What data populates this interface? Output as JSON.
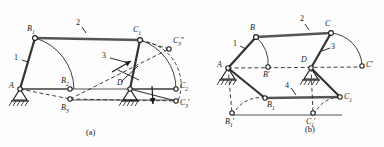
{
  "figure": {
    "type": "mechanism-kinematic-diagram",
    "colors": {
      "ink": "#1a1a1a",
      "link_bar": "#4a4a4a",
      "dashed": "#2b2b2b",
      "background": "#fdfdfd"
    }
  },
  "panels": [
    {
      "id": "a",
      "caption": "(a)",
      "link_labels": [
        {
          "key": "link1",
          "text": "1"
        },
        {
          "key": "link2",
          "text": "2"
        },
        {
          "key": "link3",
          "text": "3"
        }
      ],
      "point_labels": [
        {
          "key": "A",
          "base": "A",
          "sub": "",
          "prime": ""
        },
        {
          "key": "B1",
          "base": "B",
          "sub": "1",
          "prime": ""
        },
        {
          "key": "B2",
          "base": "B",
          "sub": "2",
          "prime": ""
        },
        {
          "key": "B3",
          "base": "B",
          "sub": "3",
          "prime": ""
        },
        {
          "key": "C1",
          "base": "C",
          "sub": "1",
          "prime": ""
        },
        {
          "key": "C2",
          "base": "C",
          "sub": "2",
          "prime": ""
        },
        {
          "key": "C3pp",
          "base": "C",
          "sub": "3",
          "prime": "″"
        },
        {
          "key": "C3p",
          "base": "C",
          "sub": "3",
          "prime": "′"
        },
        {
          "key": "D",
          "base": "D",
          "sub": "",
          "prime": ""
        }
      ]
    },
    {
      "id": "b",
      "caption": "(b)",
      "link_labels": [
        {
          "key": "link1",
          "text": "1"
        },
        {
          "key": "link2",
          "text": "2"
        },
        {
          "key": "link3",
          "text": "3"
        },
        {
          "key": "link4",
          "text": "4"
        }
      ],
      "point_labels": [
        {
          "key": "A",
          "base": "A",
          "sub": "",
          "prime": ""
        },
        {
          "key": "B",
          "base": "B",
          "sub": "",
          "prime": ""
        },
        {
          "key": "Bp",
          "base": "B",
          "sub": "",
          "prime": "′"
        },
        {
          "key": "B1",
          "base": "B",
          "sub": "1",
          "prime": ""
        },
        {
          "key": "B1p",
          "base": "B",
          "sub": "1",
          "prime": "′"
        },
        {
          "key": "C",
          "base": "C",
          "sub": "",
          "prime": ""
        },
        {
          "key": "Cp",
          "base": "C",
          "sub": "",
          "prime": "′"
        },
        {
          "key": "C1",
          "base": "C",
          "sub": "1",
          "prime": ""
        },
        {
          "key": "C1p",
          "base": "C",
          "sub": "1",
          "prime": "′"
        },
        {
          "key": "D",
          "base": "D",
          "sub": "",
          "prime": ""
        }
      ]
    }
  ]
}
